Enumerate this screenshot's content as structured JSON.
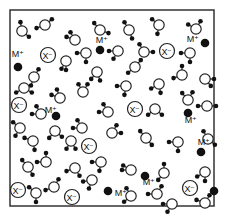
{
  "diagram": {
    "box": {
      "x": 10,
      "y": 10,
      "w": 204,
      "h": 196,
      "stroke": "#333333"
    },
    "labels": {
      "cation": "M⁺",
      "anion": "X⁻"
    },
    "colors": {
      "atom": "#111111",
      "ring": "#222222",
      "bg": "#ffffff"
    },
    "cations": [
      {
        "x": 18,
        "y": 67,
        "lx": 18,
        "ly": 57
      },
      {
        "x": 100,
        "y": 50,
        "lx": 102,
        "ly": 43
      },
      {
        "x": 205,
        "y": 43,
        "lx": 193,
        "ly": 42
      },
      {
        "x": 56,
        "y": 116,
        "lx": 51,
        "ly": 113
      },
      {
        "x": 188,
        "y": 113,
        "lx": 191,
        "ly": 123
      },
      {
        "x": 201,
        "y": 152,
        "lx": 204,
        "ly": 145
      },
      {
        "x": 145,
        "y": 176,
        "lx": 149,
        "ly": 185
      },
      {
        "x": 108,
        "y": 191,
        "lx": 121,
        "ly": 196
      },
      {
        "x": 214,
        "y": 191,
        "lx": 0,
        "ly": 0
      }
    ],
    "anions": [
      {
        "x": 48,
        "y": 55
      },
      {
        "x": 167,
        "y": 51
      },
      {
        "x": 19,
        "y": 105
      },
      {
        "x": 135,
        "y": 109
      },
      {
        "x": 89,
        "y": 146
      },
      {
        "x": 18,
        "y": 190
      },
      {
        "x": 72,
        "y": 197
      },
      {
        "x": 190,
        "y": 188
      }
    ],
    "molecules": [
      {
        "x": 22,
        "y": 31,
        "a": -100,
        "b": 40
      },
      {
        "x": 45,
        "y": 25,
        "a": -40,
        "b": 160
      },
      {
        "x": 75,
        "y": 40,
        "a": 200,
        "b": 240
      },
      {
        "x": 100,
        "y": 30,
        "a": -130,
        "b": 20
      },
      {
        "x": 129,
        "y": 30,
        "a": -120,
        "b": 70
      },
      {
        "x": 159,
        "y": 25,
        "a": -140,
        "b": 100
      },
      {
        "x": 196,
        "y": 29,
        "a": -150,
        "b": -60
      },
      {
        "x": 86,
        "y": 53,
        "a": 180,
        "b": 90
      },
      {
        "x": 118,
        "y": 51,
        "a": 180,
        "b": 120
      },
      {
        "x": 144,
        "y": 52,
        "a": -120,
        "b": 0
      },
      {
        "x": 190,
        "y": 53,
        "a": 180,
        "b": 90
      },
      {
        "x": 66,
        "y": 61,
        "a": 120,
        "b": 90
      },
      {
        "x": 97,
        "y": 72,
        "a": 70,
        "b": 130
      },
      {
        "x": 34,
        "y": 77,
        "a": -60,
        "b": 110
      },
      {
        "x": 135,
        "y": 67,
        "a": -50,
        "b": 140
      },
      {
        "x": 182,
        "y": 75,
        "a": -90,
        "b": 160
      },
      {
        "x": 205,
        "y": 79,
        "a": 0,
        "b": 50
      },
      {
        "x": 24,
        "y": 88,
        "a": 150,
        "b": 30
      },
      {
        "x": 60,
        "y": 98,
        "a": 200,
        "b": 250
      },
      {
        "x": 83,
        "y": 92,
        "a": -120,
        "b": -60
      },
      {
        "x": 126,
        "y": 86,
        "a": 180,
        "b": 100
      },
      {
        "x": 159,
        "y": 84,
        "a": 150,
        "b": 80
      },
      {
        "x": 188,
        "y": 100,
        "a": -130,
        "b": -60
      },
      {
        "x": 41,
        "y": 114,
        "a": 180,
        "b": -120
      },
      {
        "x": 108,
        "y": 112,
        "a": 180,
        "b": -120
      },
      {
        "x": 155,
        "y": 109,
        "a": 140,
        "b": 40
      },
      {
        "x": 207,
        "y": 106,
        "a": 180,
        "b": 0
      },
      {
        "x": 20,
        "y": 128,
        "a": 120,
        "b": 220
      },
      {
        "x": 33,
        "y": 141,
        "a": 200,
        "b": 80
      },
      {
        "x": 55,
        "y": 131,
        "a": 130,
        "b": 40
      },
      {
        "x": 71,
        "y": 141,
        "a": 120,
        "b": 60
      },
      {
        "x": 82,
        "y": 128,
        "a": -120,
        "b": 180
      },
      {
        "x": 112,
        "y": 133,
        "a": -60,
        "b": 0
      },
      {
        "x": 146,
        "y": 138,
        "a": -130,
        "b": 50
      },
      {
        "x": 178,
        "y": 142,
        "a": 180,
        "b": 90
      },
      {
        "x": 208,
        "y": 139,
        "a": -120,
        "b": 40
      },
      {
        "x": 28,
        "y": 167,
        "a": -130,
        "b": 60
      },
      {
        "x": 46,
        "y": 162,
        "a": 180,
        "b": -90
      },
      {
        "x": 75,
        "y": 168,
        "a": 160,
        "b": 60
      },
      {
        "x": 101,
        "y": 162,
        "a": 180,
        "b": 100
      },
      {
        "x": 131,
        "y": 170,
        "a": -150,
        "b": 180
      },
      {
        "x": 164,
        "y": 173,
        "a": -90,
        "b": 130
      },
      {
        "x": 205,
        "y": 172,
        "a": 90,
        "b": 150
      },
      {
        "x": 36,
        "y": 193,
        "a": 220,
        "b": 90
      },
      {
        "x": 54,
        "y": 187,
        "a": -60,
        "b": 160
      },
      {
        "x": 92,
        "y": 180,
        "a": 170,
        "b": 110
      },
      {
        "x": 131,
        "y": 196,
        "a": -120,
        "b": 140
      },
      {
        "x": 157,
        "y": 194,
        "a": -60,
        "b": 180
      },
      {
        "x": 172,
        "y": 204,
        "a": 180,
        "b": 120
      },
      {
        "x": 205,
        "y": 203,
        "a": 200,
        "b": -60
      }
    ]
  }
}
